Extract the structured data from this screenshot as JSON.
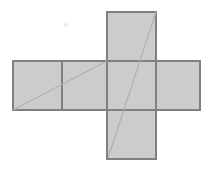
{
  "figure": {
    "type": "geometric-diagram",
    "canvas": {
      "width": 211,
      "height": 169,
      "background": "#ffffff"
    },
    "style": {
      "face_fill": "#cccccc",
      "face_stroke": "#808080",
      "face_stroke_width": 1.5,
      "diagonal_stroke": "#b0b0b0",
      "diagonal_stroke_width": 1.2,
      "speck_fill": "#f0f0f0"
    },
    "grid": {
      "columns_x": [
        13,
        62,
        107,
        156,
        200
      ],
      "rows_y": [
        12,
        61,
        110,
        159
      ],
      "cell_width": 48,
      "cell_height": 49
    },
    "faces": [
      {
        "name": "face-top",
        "label": "top",
        "x": 107,
        "y": 12,
        "width": 49,
        "height": 49
      },
      {
        "name": "face-left-outer",
        "label": "left-outer",
        "x": 13,
        "y": 61,
        "width": 49,
        "height": 49
      },
      {
        "name": "face-left-inner",
        "label": "left-inner",
        "x": 62,
        "y": 61,
        "width": 45,
        "height": 49
      },
      {
        "name": "face-center",
        "label": "center",
        "x": 107,
        "y": 61,
        "width": 49,
        "height": 49
      },
      {
        "name": "face-right",
        "label": "right",
        "x": 156,
        "y": 61,
        "width": 44,
        "height": 49
      },
      {
        "name": "face-bottom",
        "label": "bottom",
        "x": 107,
        "y": 110,
        "width": 49,
        "height": 49
      }
    ],
    "diagonals": [
      {
        "name": "diagonal-horizontal-band",
        "label": "short diagonal across left faces",
        "x1": 13,
        "y1": 110,
        "x2": 107,
        "y2": 61
      },
      {
        "name": "diagonal-vertical-strip",
        "label": "long diagonal across bottom, center and top faces",
        "x1": 108,
        "y1": 158,
        "x2": 156,
        "y2": 12
      }
    ],
    "speck": {
      "name": "background-speck",
      "x": 66,
      "y": 25,
      "radius": 2.2
    }
  }
}
